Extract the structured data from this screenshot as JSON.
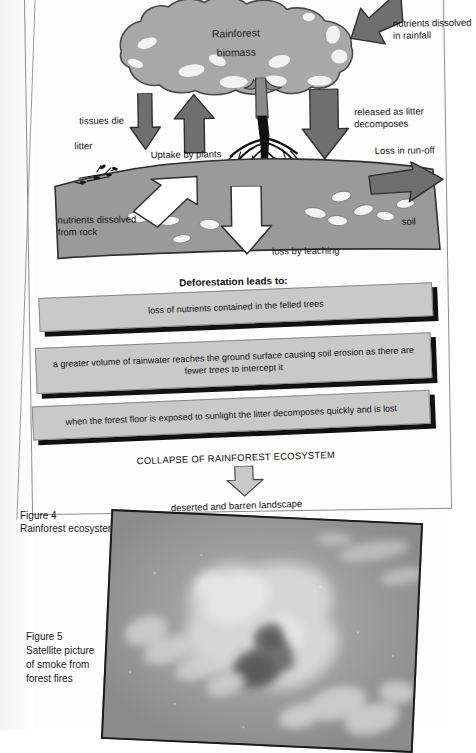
{
  "document": {
    "type": "scanned-textbook-page",
    "figure4": {
      "caption_line1": "Figure 4",
      "caption_line2": "Rainforest ecosystem",
      "diagram": {
        "canopy_label_line1": "Rainforest",
        "canopy_label_line2": "biomass",
        "soil_label": "soil",
        "labels": [
          {
            "id": "nutrients-rainfall",
            "text": "nutrients dissolved",
            "text2": "in rainfall"
          },
          {
            "id": "tissues-die",
            "text": "tissues die"
          },
          {
            "id": "litter",
            "text": "litter"
          },
          {
            "id": "uptake",
            "text": "Uptake by plants"
          },
          {
            "id": "released-litter",
            "text": "released as litter",
            "text2": "decomposes"
          },
          {
            "id": "run-off",
            "text": "Loss in run-off"
          },
          {
            "id": "nutrients-rock",
            "text": "nutrients dissolved",
            "text2": "from rock"
          },
          {
            "id": "leaching",
            "text": "loss by leaching"
          }
        ]
      },
      "deforestation": {
        "title": "Deforestation leads to:",
        "consequences": [
          "loss of nutrients contained in the felled trees",
          "a greater volume of rainwater reaches the ground surface causing soil erosion as there are fewer trees to intercept it",
          "when the forest floor is exposed to sunlight the litter decomposes quickly and is lost"
        ],
        "collapse_text": "COLLAPSE OF RAINFOREST ECOSYSTEM",
        "outcome_text": "deserted and barren landscape"
      }
    },
    "figure5": {
      "caption_line1": "Figure 5",
      "caption_line2": "Satellite picture",
      "caption_line3": "of smoke from",
      "caption_line4": "forest fires"
    }
  },
  "colors": {
    "canopy_fill": "#a8a8a8",
    "canopy_stroke": "#4a4a4a",
    "soil_fill": "#9a9a9a",
    "soil_stroke": "#3a3a3a",
    "arrow_dark": "#6f6f6f",
    "arrow_light": "#ffffff",
    "bar_fill": "#c9c9c9",
    "bar_shadow": "#111111",
    "page_bg": "#ffffff",
    "text": "#111111"
  }
}
